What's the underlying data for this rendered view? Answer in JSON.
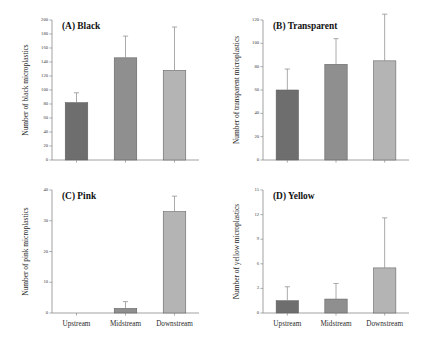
{
  "figure": {
    "categories": [
      "Upstream",
      "Midstream",
      "Downstream"
    ],
    "bar_colors": [
      "#6e6e6e",
      "#8f8f8f",
      "#b4b4b4"
    ]
  },
  "chart_data": [
    {
      "type": "bar",
      "panel": "A",
      "title": "(A) Black",
      "categories": [
        "Upstream",
        "Midstream",
        "Downstream"
      ],
      "values": [
        82,
        146,
        128
      ],
      "errors": [
        14,
        31,
        62
      ],
      "xlabel": "",
      "ylabel": "Number of black microplastics",
      "ylim": [
        0,
        200
      ],
      "yticks": [
        0,
        20,
        40,
        60,
        80,
        100,
        120,
        140,
        160,
        180,
        200
      ],
      "grid": false,
      "legend": "none"
    },
    {
      "type": "bar",
      "panel": "B",
      "title": "(B) Transparent",
      "categories": [
        "Upstream",
        "Midstream",
        "Downstream"
      ],
      "values": [
        60,
        82,
        85
      ],
      "errors": [
        18,
        22,
        40
      ],
      "xlabel": "",
      "ylabel": "Number of transparent microplastics",
      "ylim": [
        0,
        120
      ],
      "yticks": [
        0,
        20,
        40,
        60,
        80,
        100,
        120
      ],
      "grid": false,
      "legend": "none"
    },
    {
      "type": "bar",
      "panel": "C",
      "title": "(C) Pink",
      "categories": [
        "Upstream",
        "Midstream",
        "Downstream"
      ],
      "values": [
        0,
        1.5,
        33
      ],
      "errors": [
        0,
        2.2,
        5
      ],
      "xlabel": "",
      "ylabel": "Number of pink microplastics",
      "ylim": [
        0,
        40
      ],
      "yticks": [
        0,
        10,
        20,
        30,
        40
      ],
      "grid": false,
      "legend": "none"
    },
    {
      "type": "bar",
      "panel": "D",
      "title": "(D) Yellow",
      "categories": [
        "Upstream",
        "Midstream",
        "Downstream"
      ],
      "values": [
        1.5,
        1.7,
        5.5
      ],
      "errors": [
        1.7,
        1.9,
        6.1
      ],
      "xlabel": "",
      "ylabel": "Number of yellow microplastics",
      "ylim": [
        0,
        15
      ],
      "yticks": [
        0,
        3,
        6,
        9,
        12,
        15
      ],
      "grid": false,
      "legend": "none"
    }
  ]
}
